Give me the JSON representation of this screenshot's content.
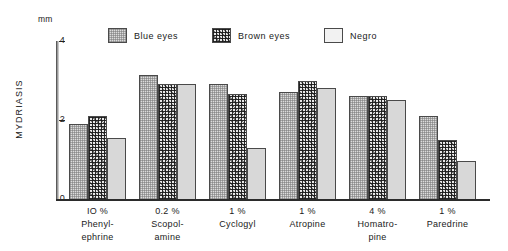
{
  "chart_data": {
    "type": "bar",
    "title": "",
    "xlabel": "",
    "ylabel": "MYDRIASIS",
    "yunit": "mm",
    "ylim": [
      0,
      4
    ],
    "yticks": [
      0,
      2,
      4
    ],
    "ytick_labels": [
      "0",
      "2",
      "4"
    ],
    "grid": false,
    "legend_position": "top-center",
    "categories": [
      "Phenyl-\nephrine",
      "Scopol-\namine",
      "Cyclogyl",
      "Atropine",
      "Homatro-\npine",
      "Paredrine"
    ],
    "category_concentrations": [
      "IO %",
      "0.2 %",
      "1 %",
      "1 %",
      "4 %",
      "1 %"
    ],
    "series": [
      {
        "name": "Blue eyes",
        "values": [
          1.9,
          3.15,
          2.9,
          2.7,
          2.6,
          2.1
        ]
      },
      {
        "name": "Brown eyes",
        "values": [
          2.1,
          2.9,
          2.65,
          3.0,
          2.6,
          1.5
        ]
      },
      {
        "name": "Negro",
        "values": [
          1.55,
          2.9,
          1.3,
          2.8,
          2.5,
          0.95
        ]
      }
    ]
  },
  "legend": {
    "items": [
      {
        "label": "Blue eyes",
        "pattern": "fill-blue"
      },
      {
        "label": "Brown eyes",
        "pattern": "fill-brown"
      },
      {
        "label": "Negro",
        "pattern": "fill-negro"
      }
    ]
  }
}
